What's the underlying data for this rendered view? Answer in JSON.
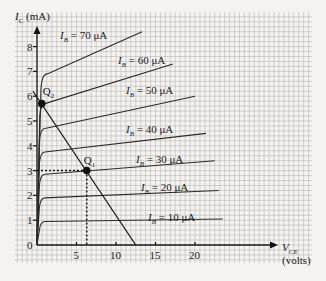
{
  "chart_data": {
    "type": "line",
    "title": "",
    "xlabel": "V_CE (volts)",
    "ylabel": "I_C (mA)",
    "xlim": [
      0,
      25
    ],
    "ylim": [
      0,
      9
    ],
    "x_ticks": [
      5,
      10,
      15,
      20
    ],
    "y_ticks": [
      0,
      1,
      2,
      3,
      4,
      5,
      6,
      7,
      8
    ],
    "grid": true,
    "series": [
      {
        "name": "I_B = 10 μA",
        "label_prefix": "I",
        "label_sub": "B",
        "label_value": " = 10 μA",
        "points": [
          [
            0,
            0
          ],
          [
            0.3,
            0.6
          ],
          [
            1,
            0.95
          ],
          [
            23.5,
            1.05
          ]
        ]
      },
      {
        "name": "I_B = 20 μA",
        "label_prefix": "I",
        "label_sub": "B",
        "label_value": " = 20 μA",
        "points": [
          [
            0,
            0
          ],
          [
            0.3,
            1.5
          ],
          [
            1,
            1.9
          ],
          [
            23,
            2.2
          ]
        ]
      },
      {
        "name": "I_B = 30 μA",
        "label_prefix": "I",
        "label_sub": "B",
        "label_value": " = 30 μA",
        "points": [
          [
            0,
            0
          ],
          [
            0.3,
            2.4
          ],
          [
            1,
            2.85
          ],
          [
            22.5,
            3.4
          ]
        ]
      },
      {
        "name": "I_B = 40 μA",
        "label_prefix": "I",
        "label_sub": "B",
        "label_value": " = 40 μA",
        "points": [
          [
            0,
            0
          ],
          [
            0.3,
            3.3
          ],
          [
            1,
            3.75
          ],
          [
            21.4,
            4.5
          ]
        ]
      },
      {
        "name": "I_B = 50 μA",
        "label_prefix": "I",
        "label_sub": "B",
        "label_value": " = 50 μA",
        "points": [
          [
            0,
            0
          ],
          [
            0.3,
            4.2
          ],
          [
            1,
            4.7
          ],
          [
            20,
            6.0
          ]
        ]
      },
      {
        "name": "I_B = 60 μA",
        "label_prefix": "I",
        "label_sub": "B",
        "label_value": " = 60 μA",
        "points": [
          [
            0,
            0
          ],
          [
            0.35,
            5.2
          ],
          [
            1,
            5.7
          ],
          [
            17.2,
            7.3
          ]
        ]
      },
      {
        "name": "I_B = 70 μA",
        "label_prefix": "I",
        "label_sub": "B",
        "label_value": " = 70 μA",
        "points": [
          [
            0,
            0
          ],
          [
            0.5,
            6.3
          ],
          [
            1.3,
            6.9
          ],
          [
            13.3,
            8.6
          ]
        ]
      }
    ],
    "load_line": {
      "points": [
        [
          -0.5,
          6.2
        ],
        [
          12.5,
          0
        ]
      ]
    },
    "operating_points": [
      {
        "name": "Q1",
        "label": "Q",
        "sub": "1",
        "vce": 6.3,
        "ic": 3.0
      },
      {
        "name": "Q2",
        "label": "Q",
        "sub": "2",
        "vce": 0.6,
        "ic": 5.7
      }
    ],
    "annotations": [
      "Q1 projected to axes with dotted lines at V_CE ≈ 6.3 V and I_C = 3 mA"
    ]
  },
  "labels": {
    "y_axis_main": "I",
    "y_axis_sub": "C",
    "y_axis_unit": " (mA)",
    "x_axis_main": "V",
    "x_axis_sub": "CE",
    "x_axis_unit": "(volts)",
    "origin": "0"
  }
}
